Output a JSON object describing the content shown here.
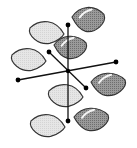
{
  "diagram": {
    "title": "",
    "colors": {
      "background": "#ffffff",
      "light_lobe": "#e2e2e2",
      "dark_lobe": "#8a8a8a",
      "outline": "#333333",
      "axis": "#111111",
      "node": "#000000",
      "highlight": "#ffffff"
    },
    "nodes": [
      {
        "id": "top",
        "x": 68,
        "y": 25
      },
      {
        "id": "upper-left",
        "x": 49,
        "y": 52
      },
      {
        "id": "center",
        "x": 68,
        "y": 71
      },
      {
        "id": "left",
        "x": 18,
        "y": 80
      },
      {
        "id": "right",
        "x": 116,
        "y": 62
      },
      {
        "id": "lower-right",
        "x": 86,
        "y": 88
      },
      {
        "id": "bottom",
        "x": 68,
        "y": 121
      }
    ],
    "axes": [
      {
        "id": "vertical-axis",
        "from": "top",
        "to": "bottom"
      },
      {
        "id": "horizontal-axis",
        "from": "left",
        "to": "right"
      },
      {
        "id": "diagonal-axis",
        "from": "upper-left",
        "to": "lower-right"
      }
    ],
    "lobes": [
      {
        "id": "lobe-1-light",
        "phase": "light",
        "cx": 46,
        "cy": 32,
        "rx": 18,
        "ry": 12,
        "dir": "right"
      },
      {
        "id": "lobe-1-dark",
        "phase": "dark",
        "cx": 89,
        "cy": 19,
        "rx": 17,
        "ry": 13,
        "dir": "left"
      },
      {
        "id": "lobe-2-light",
        "phase": "light",
        "cx": 28,
        "cy": 59,
        "rx": 18,
        "ry": 12,
        "dir": "right"
      },
      {
        "id": "lobe-2-dark",
        "phase": "dark",
        "cx": 71,
        "cy": 47,
        "rx": 17,
        "ry": 12,
        "dir": "left"
      },
      {
        "id": "lobe-3-light",
        "phase": "light",
        "cx": 65,
        "cy": 95,
        "rx": 18,
        "ry": 12,
        "dir": "right"
      },
      {
        "id": "lobe-3-dark",
        "phase": "dark",
        "cx": 109,
        "cy": 84,
        "rx": 18,
        "ry": 12,
        "dir": "left"
      },
      {
        "id": "lobe-4-light",
        "phase": "light",
        "cx": 47,
        "cy": 125,
        "rx": 18,
        "ry": 12,
        "dir": "right"
      },
      {
        "id": "lobe-4-dark",
        "phase": "dark",
        "cx": 92,
        "cy": 119,
        "rx": 18,
        "ry": 12,
        "dir": "left"
      }
    ]
  }
}
